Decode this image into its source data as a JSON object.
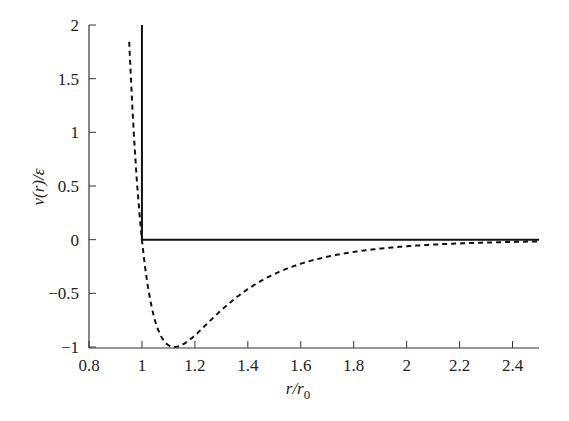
{
  "chart_data": {
    "type": "line",
    "title": "",
    "xlabel": "r/r0",
    "ylabel": "v(r)/ε",
    "xlim": [
      0.8,
      2.5
    ],
    "ylim": [
      -1,
      2
    ],
    "grid": false,
    "legend": null,
    "x_ticks": [
      0.8,
      1,
      1.2,
      1.4,
      1.6,
      1.8,
      2,
      2.2,
      2.4
    ],
    "x_tick_labels": [
      "0.8",
      "1",
      "1.2",
      "1.4",
      "1.6",
      "1.8",
      "2",
      "2.2",
      "2.4"
    ],
    "y_ticks": [
      -1,
      -0.5,
      0,
      0.5,
      1,
      1.5,
      2
    ],
    "y_tick_labels": [
      "−1",
      "−0.5",
      "0",
      "0.5",
      "1",
      "1.5",
      "2"
    ],
    "series": [
      {
        "name": "hard-sphere potential",
        "style": "solid",
        "color": "#111111",
        "x": [
          1.0,
          1.0,
          2.5
        ],
        "y": [
          2.0,
          0.0,
          0.0
        ]
      },
      {
        "name": "Lennard-Jones potential",
        "style": "dashed",
        "color": "#111111",
        "x": [
          0.95,
          0.97,
          1.0,
          1.03,
          1.06,
          1.09,
          1.122,
          1.15,
          1.2,
          1.3,
          1.4,
          1.5,
          1.6,
          1.8,
          2.0,
          2.2,
          2.4,
          2.5
        ],
        "y": [
          2.0,
          1.0,
          0.0,
          -0.45,
          -0.75,
          -0.93,
          -1.0,
          -0.98,
          -0.88,
          -0.63,
          -0.45,
          -0.32,
          -0.23,
          -0.12,
          -0.06,
          -0.035,
          -0.02,
          -0.016
        ]
      }
    ]
  },
  "axes": {
    "x_title_main": "r/r",
    "x_title_sub": "0",
    "y_title": "v(r)/ε"
  }
}
